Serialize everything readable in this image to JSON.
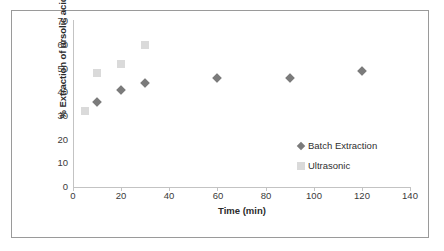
{
  "chart_data": {
    "type": "scatter",
    "title": "",
    "xlabel": "Time (min)",
    "ylabel": "% Extraction of ursolic acid",
    "xlim": [
      0,
      140
    ],
    "ylim": [
      0,
      70
    ],
    "xticks": [
      0,
      20,
      40,
      60,
      80,
      100,
      120,
      140
    ],
    "yticks": [
      0,
      10,
      20,
      30,
      40,
      50,
      60,
      70
    ],
    "grid": false,
    "legend_position": "inside-right",
    "series": [
      {
        "name": "Batch Extraction",
        "marker": "diamond",
        "color": "#7b7b7b",
        "x": [
          10,
          20,
          30,
          60,
          90,
          120
        ],
        "y": [
          36,
          41,
          44,
          46,
          46,
          49
        ]
      },
      {
        "name": "Ultrasonic",
        "marker": "square",
        "color": "#dadada",
        "x": [
          5,
          10,
          20,
          30
        ],
        "y": [
          32,
          48,
          52,
          60
        ]
      }
    ]
  },
  "legend": {
    "items": [
      {
        "label": "Batch Extraction",
        "marker": "diamond"
      },
      {
        "label": "Ultrasonic",
        "marker": "square"
      }
    ]
  },
  "axis_labels": {
    "x": "Time (min)",
    "y": "% Extraction of ursolic acid"
  },
  "ytick_labels": [
    "70",
    "60",
    "50",
    "40",
    "30",
    "20",
    "10",
    "0"
  ],
  "xtick_labels": [
    "0",
    "20",
    "40",
    "60",
    "80",
    "100",
    "120",
    "140"
  ]
}
